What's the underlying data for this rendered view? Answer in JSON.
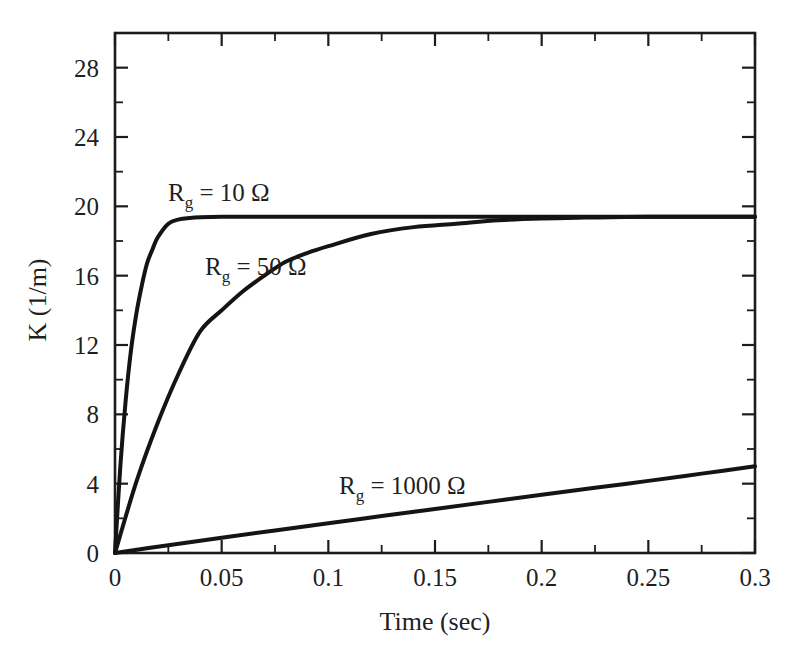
{
  "figure": {
    "background_color": "#ffffff",
    "ink_color": "#141414"
  },
  "chart_data": {
    "type": "line",
    "title": "",
    "subtitle": "",
    "xlabel": "Time (sec)",
    "ylabel": "K (1/m)",
    "xlim": [
      0,
      0.3
    ],
    "ylim": [
      0,
      30
    ],
    "xticks": [
      0,
      0.05,
      0.1,
      0.15,
      0.2,
      0.25,
      0.3
    ],
    "xtick_labels": [
      "0",
      "0.05",
      "0.1",
      "0.15",
      "0.2",
      "0.25",
      "0.3"
    ],
    "xminor_step": 0.025,
    "yticks": [
      0,
      4,
      8,
      12,
      16,
      20,
      24,
      28
    ],
    "ytick_labels": [
      "0",
      "4",
      "8",
      "12",
      "16",
      "20",
      "24",
      "28"
    ],
    "yminor_step": 2,
    "grid": false,
    "legend_position": "inline-annotations",
    "saturation_value": 19.4,
    "series": [
      {
        "name": "R_g = 10 Ω",
        "label_html": "R<sub>g</sub> = 10 Ω",
        "resistance_ohm": 10,
        "time_constant_sec": 0.0085,
        "asymptote": 19.4,
        "color": "#141414",
        "annotation": {
          "text": "R₉ = 10 Ω",
          "x": 0.055,
          "y": 21.3
        },
        "x": [
          0,
          0.0025,
          0.005,
          0.0075,
          0.01,
          0.0125,
          0.015,
          0.0175,
          0.02,
          0.025,
          0.03,
          0.035,
          0.04,
          0.05,
          0.06,
          0.07,
          0.08,
          0.1,
          0.12,
          0.15,
          0.2,
          0.25,
          0.3
        ],
        "y": [
          0,
          5.0,
          8.8,
          11.7,
          13.8,
          15.4,
          16.7,
          17.5,
          18.2,
          19.0,
          19.25,
          19.33,
          19.37,
          19.4,
          19.4,
          19.4,
          19.4,
          19.4,
          19.4,
          19.4,
          19.4,
          19.4,
          19.4
        ]
      },
      {
        "name": "R_g = 50 Ω",
        "label_html": "R<sub>g</sub> = 50 Ω",
        "resistance_ohm": 50,
        "time_constant_sec": 0.042,
        "asymptote": 19.4,
        "color": "#141414",
        "annotation": {
          "text": "R₉ = 50 Ω",
          "x": 0.066,
          "y": 16.9
        },
        "x": [
          0,
          0.01,
          0.02,
          0.03,
          0.04,
          0.05,
          0.06,
          0.07,
          0.08,
          0.09,
          0.1,
          0.12,
          0.14,
          0.16,
          0.18,
          0.2,
          0.22,
          0.25,
          0.3
        ],
        "y": [
          0,
          4.1,
          7.5,
          10.4,
          12.8,
          14.0,
          15.1,
          16.0,
          16.8,
          17.3,
          17.7,
          18.4,
          18.8,
          19.0,
          19.2,
          19.3,
          19.35,
          19.4,
          19.4
        ]
      },
      {
        "name": "R_g = 1000 Ω",
        "label_html": "R<sub>g</sub> = 1000 Ω",
        "resistance_ohm": 1000,
        "time_constant_sec": 0.85,
        "asymptote": 19.4,
        "color": "#141414",
        "annotation": {
          "text": "R₉ = 1000 Ω",
          "x": 0.098,
          "y": 4.0
        },
        "x": [
          0,
          0.025,
          0.05,
          0.075,
          0.1,
          0.125,
          0.15,
          0.175,
          0.2,
          0.225,
          0.25,
          0.275,
          0.3
        ],
        "y": [
          0,
          0.45,
          0.88,
          1.3,
          1.72,
          2.13,
          2.54,
          2.95,
          3.36,
          3.76,
          4.16,
          4.58,
          5.0
        ]
      }
    ]
  },
  "annotations": {
    "rg10": {
      "prefix": "R",
      "sub": "g",
      "suffix": " = 10 Ω"
    },
    "rg50": {
      "prefix": "R",
      "sub": "g",
      "suffix": " = 50 Ω"
    },
    "rg1000": {
      "prefix": "R",
      "sub": "g",
      "suffix": " = 1000 Ω"
    }
  }
}
